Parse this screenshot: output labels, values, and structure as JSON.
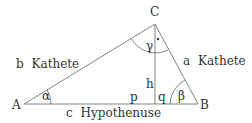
{
  "diagram": {
    "type": "right-triangle",
    "vertices": {
      "A": {
        "label": "A",
        "x": 24,
        "y": 104
      },
      "B": {
        "label": "B",
        "x": 198,
        "y": 104
      },
      "C": {
        "label": "C",
        "x": 155,
        "y": 24
      }
    },
    "altitude_foot": {
      "x": 155,
      "y": 104
    },
    "sides": {
      "b": {
        "letter": "b",
        "name": "Kathete"
      },
      "a": {
        "letter": "a",
        "name": "Kathete"
      },
      "c": {
        "letter": "c",
        "name": "Hypothenuse"
      }
    },
    "segments": {
      "h": "h",
      "p": "p",
      "q": "q"
    },
    "angles": {
      "alpha": "α",
      "beta": "β",
      "gamma": "γ",
      "right_angle_marker": "•"
    },
    "colors": {
      "line": "#777777",
      "text": "#333333",
      "background": "#ffffff"
    }
  }
}
